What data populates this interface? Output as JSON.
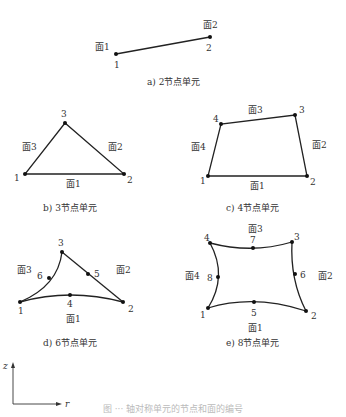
{
  "figure_caption": "图 ··· 轴对称单元的节点和面的编号",
  "axes": {
    "z_label": "z",
    "r_label": "r",
    "origin": [
      13,
      404
    ],
    "z_end": [
      13,
      362
    ],
    "r_end": [
      62,
      404
    ]
  },
  "elements": [
    {
      "id": "a",
      "caption": "a) 2节点单元",
      "caption_pos": [
        147,
        85
      ],
      "nodes": [
        {
          "n": "1",
          "x": 116,
          "y": 54,
          "lx": 114,
          "ly": 68
        },
        {
          "n": "2",
          "x": 210,
          "y": 37,
          "lx": 206,
          "ly": 51
        }
      ],
      "edges": [
        {
          "path": "M116 54 L210 37"
        }
      ],
      "faces": [
        {
          "label": "面1",
          "x": 95,
          "y": 50
        },
        {
          "label": "面2",
          "x": 203,
          "y": 28
        }
      ]
    },
    {
      "id": "b",
      "caption": "b) 3节点单元",
      "caption_pos": [
        43,
        211
      ],
      "nodes": [
        {
          "n": "1",
          "x": 25,
          "y": 174,
          "lx": 14,
          "ly": 181
        },
        {
          "n": "2",
          "x": 124,
          "y": 174,
          "lx": 127,
          "ly": 183
        },
        {
          "n": "3",
          "x": 65,
          "y": 123,
          "lx": 61,
          "ly": 117
        }
      ],
      "edges": [
        {
          "path": "M25 174 L124 174 L65 123 Z"
        }
      ],
      "faces": [
        {
          "label": "面1",
          "x": 66,
          "y": 187
        },
        {
          "label": "面2",
          "x": 108,
          "y": 150
        },
        {
          "label": "面3",
          "x": 22,
          "y": 150
        }
      ]
    },
    {
      "id": "c",
      "caption": "c) 4节点单元",
      "caption_pos": [
        226,
        211
      ],
      "nodes": [
        {
          "n": "1",
          "x": 208,
          "y": 176,
          "lx": 200,
          "ly": 184
        },
        {
          "n": "2",
          "x": 307,
          "y": 176,
          "lx": 310,
          "ly": 185
        },
        {
          "n": "3",
          "x": 295,
          "y": 115,
          "lx": 299,
          "ly": 113
        },
        {
          "n": "4",
          "x": 221,
          "y": 124,
          "lx": 213,
          "ly": 122
        }
      ],
      "edges": [
        {
          "path": "M208 176 L307 176 L295 115 L221 124 Z"
        }
      ],
      "faces": [
        {
          "label": "面1",
          "x": 250,
          "y": 189
        },
        {
          "label": "面2",
          "x": 312,
          "y": 148
        },
        {
          "label": "面3",
          "x": 248,
          "y": 113
        },
        {
          "label": "面4",
          "x": 191,
          "y": 150
        }
      ]
    },
    {
      "id": "d",
      "caption": "d) 6节点单元",
      "caption_pos": [
        43,
        346
      ],
      "nodes": [
        {
          "n": "1",
          "x": 20,
          "y": 302,
          "lx": 18,
          "ly": 314
        },
        {
          "n": "2",
          "x": 123,
          "y": 302,
          "lx": 128,
          "ly": 312
        },
        {
          "n": "3",
          "x": 62,
          "y": 252,
          "lx": 58,
          "ly": 246
        },
        {
          "n": "4",
          "x": 70,
          "y": 295,
          "lx": 67,
          "ly": 307
        },
        {
          "n": "5",
          "x": 88,
          "y": 274,
          "lx": 94,
          "ly": 277
        },
        {
          "n": "6",
          "x": 49,
          "y": 278,
          "lx": 37,
          "ly": 279
        }
      ],
      "edges": [
        {
          "path": "M20 302 Q70 288 123 302"
        },
        {
          "path": "M123 302 L62 252"
        },
        {
          "path": "M62 252 Q58 286 20 302"
        }
      ],
      "faces": [
        {
          "label": "面1",
          "x": 66,
          "y": 322
        },
        {
          "label": "面2",
          "x": 116,
          "y": 273
        },
        {
          "label": "面3",
          "x": 17,
          "y": 273
        }
      ]
    },
    {
      "id": "e",
      "caption": "e) 8节点单元",
      "caption_pos": [
        226,
        346
      ],
      "nodes": [
        {
          "n": "1",
          "x": 208,
          "y": 308,
          "lx": 200,
          "ly": 318
        },
        {
          "n": "2",
          "x": 306,
          "y": 311,
          "lx": 311,
          "ly": 319
        },
        {
          "n": "3",
          "x": 292,
          "y": 242,
          "lx": 294,
          "ly": 240
        },
        {
          "n": "4",
          "x": 210,
          "y": 243,
          "lx": 204,
          "ly": 241
        },
        {
          "n": "5",
          "x": 254,
          "y": 302,
          "lx": 251,
          "ly": 316
        },
        {
          "n": "6",
          "x": 295,
          "y": 274,
          "lx": 300,
          "ly": 278
        },
        {
          "n": "7",
          "x": 253,
          "y": 248,
          "lx": 250,
          "ly": 243
        },
        {
          "n": "8",
          "x": 218,
          "y": 277,
          "lx": 207,
          "ly": 281
        }
      ],
      "edges": [
        {
          "path": "M208 308 Q254 294 306 311"
        },
        {
          "path": "M306 311 Q290 280 292 242"
        },
        {
          "path": "M292 242 Q252 254 210 243"
        },
        {
          "path": "M210 243 Q228 276 208 308"
        }
      ],
      "faces": [
        {
          "label": "面1",
          "x": 248,
          "y": 331
        },
        {
          "label": "面2",
          "x": 318,
          "y": 279
        },
        {
          "label": "面3",
          "x": 248,
          "y": 232
        },
        {
          "label": "面4",
          "x": 185,
          "y": 279
        }
      ]
    }
  ]
}
